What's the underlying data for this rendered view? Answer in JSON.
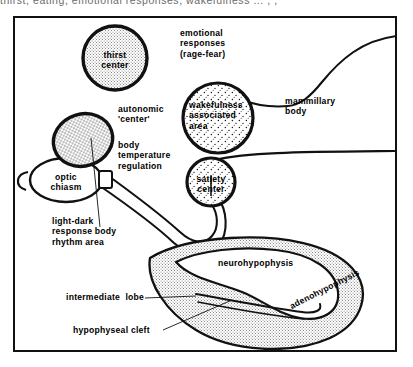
{
  "figure": {
    "clipped_caption": "thirst, eating, emotional responses, wakefulness   ... ,  ,"
  },
  "colors": {
    "ink": "#111111",
    "paper": "#ffffff",
    "stipple_light": "#d8d8d8",
    "stipple_mid": "#c9c9c9",
    "frame": "#111111"
  },
  "regions": [
    {
      "id": "thirst-center",
      "label": "thirst\ncenter",
      "shape": "circle",
      "fill": "fine-stipple"
    },
    {
      "id": "autonomic-center",
      "label": "autonomic\n'center'",
      "shape": "ellipse",
      "fill": "cross-hatch"
    },
    {
      "id": "optic-chiasm",
      "label": "optic\nchiasm",
      "shape": "ellipse",
      "fill": "white"
    },
    {
      "id": "wakefulness-area",
      "label": "wakefulness\nassociated\narea",
      "shape": "circle",
      "fill": "coarse-stipple"
    },
    {
      "id": "satiety-center",
      "label": "satiety\ncenter",
      "shape": "circle",
      "fill": "coarse-stipple"
    },
    {
      "id": "adenohypophysis",
      "label": "adenohypophysis",
      "shape": "crescent",
      "fill": "fine-stipple"
    },
    {
      "id": "neurohypophysis",
      "label": "neurohypophysis",
      "shape": "lobe",
      "fill": "white"
    }
  ],
  "labels": {
    "thirst_center": "thirst\ncenter",
    "emotional_responses": "emotional\nresponses\n(rage-fear)",
    "autonomic_center": "autonomic\n'center'",
    "body_temperature": "body\ntemperature\nregulation",
    "wakefulness_area": "wakefulness\nassociated\narea",
    "mammillary_body": "mammillary\nbody",
    "optic_chiasm": "optic\nchiasm",
    "satiety_center": "satiety\ncenter",
    "light_dark": "light-dark\nresponse body\nrhythm area",
    "neurohypophysis": "neurohypophysis",
    "intermediate_lobe": "intermediate  lobe",
    "hypophyseal_cleft": "hypophyseal cleft",
    "adenohypophysis": "adenohypophysis"
  }
}
